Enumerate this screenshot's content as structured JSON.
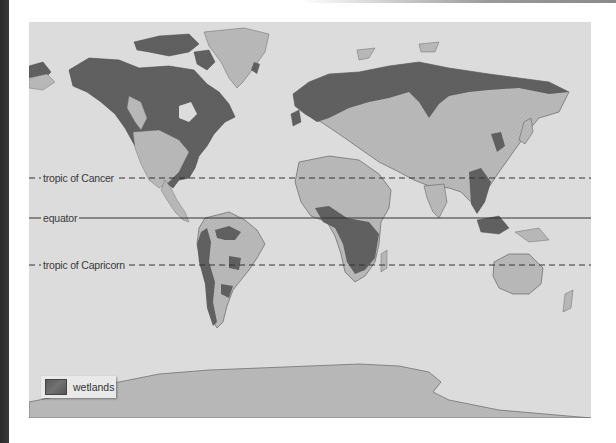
{
  "map": {
    "title": "World wetlands distribution",
    "colors": {
      "ocean": "#dcdcdc",
      "land": "#b9b9b9",
      "land_relief": "#a8a8a8",
      "wetlands": "#5e5e5e",
      "coastline": "#555555",
      "reference_line": "#333333"
    },
    "reference_lines": [
      {
        "id": "tropic-of-cancer",
        "label": "tropic of Cancer",
        "style": "dashed",
        "y": 178
      },
      {
        "id": "equator",
        "label": "equator",
        "style": "solid",
        "y": 218
      },
      {
        "id": "tropic-of-capricorn",
        "label": "tropic of Capricorn",
        "style": "dashed",
        "y": 265
      }
    ],
    "legend": {
      "items": [
        {
          "label": "wetlands",
          "swatch_color": "#5e5e5e"
        }
      ]
    }
  }
}
